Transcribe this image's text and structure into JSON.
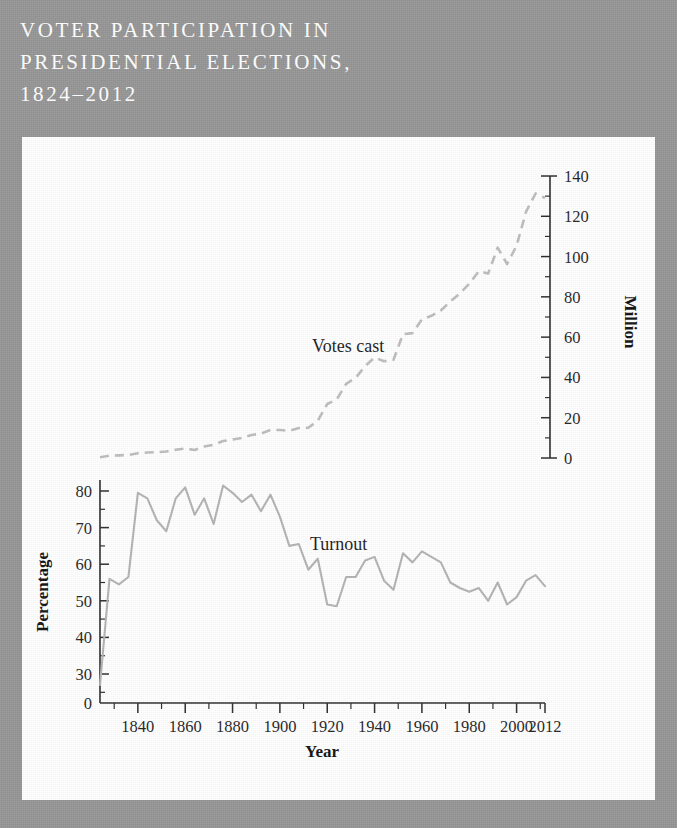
{
  "figure": {
    "title": "Voter Participation in\nPresidential Elections,\n1824–2012",
    "background_color": "#959595",
    "panel_color": "#ffffff",
    "title_color": "#ffffff"
  },
  "labels": {
    "votes_cast": "Votes cast",
    "turnout": "Turnout",
    "x_axis_title": "Year",
    "left_axis_title": "Percentage",
    "right_axis_title": "Million"
  },
  "chart_data": {
    "type": "line",
    "title": "Voter Participation in Presidential Elections, 1824–2012",
    "xlabel": "Year",
    "grid": false,
    "legend": "inline-annotations",
    "xlim": [
      1824,
      2012
    ],
    "x_ticks_major": [
      1840,
      1860,
      1880,
      1900,
      1920,
      1940,
      1960,
      1980,
      2000,
      2012
    ],
    "x_tick_labels": [
      "1840",
      "1860",
      "1880",
      "1900",
      "1920",
      "1940",
      "1960",
      "1980",
      "2000",
      "2012"
    ],
    "x_tick_minor_step": 10,
    "left_axis": {
      "label": "Percentage",
      "ylim": [
        25,
        85
      ],
      "ticks": [
        30,
        40,
        50,
        60,
        70,
        80
      ],
      "tick_labels": [
        "30",
        "40",
        "50",
        "60",
        "70",
        "80"
      ],
      "zero_label": "0",
      "minor_step": 5,
      "broken_axis": true,
      "color": "#b3b3b3"
    },
    "right_axis": {
      "label": "Million",
      "ylim": [
        0,
        140
      ],
      "ticks": [
        0,
        20,
        40,
        60,
        80,
        100,
        120,
        140
      ],
      "tick_labels": [
        "0",
        "20",
        "40",
        "60",
        "80",
        "100",
        "120",
        "140"
      ],
      "minor_step": 10,
      "color": "#bdbdbd"
    },
    "x": [
      1824,
      1828,
      1832,
      1836,
      1840,
      1844,
      1848,
      1852,
      1856,
      1860,
      1864,
      1868,
      1872,
      1876,
      1880,
      1884,
      1888,
      1892,
      1896,
      1900,
      1904,
      1908,
      1912,
      1916,
      1920,
      1924,
      1928,
      1932,
      1936,
      1940,
      1944,
      1948,
      1952,
      1956,
      1960,
      1964,
      1968,
      1972,
      1976,
      1980,
      1984,
      1988,
      1992,
      1996,
      2000,
      2004,
      2008,
      2012
    ],
    "series": [
      {
        "name": "Turnout",
        "axis": "left",
        "unit": "percent",
        "style": "solid",
        "values": [
          27.0,
          56.0,
          54.5,
          56.5,
          79.5,
          78.0,
          72.0,
          69.0,
          78.0,
          81.0,
          73.5,
          78.0,
          71.0,
          81.5,
          79.5,
          77.0,
          79.0,
          74.5,
          79.0,
          73.0,
          65.0,
          65.5,
          58.5,
          61.5,
          49.0,
          48.5,
          56.5,
          56.5,
          61.0,
          62.0,
          55.5,
          53.0,
          63.0,
          60.5,
          63.5,
          62.0,
          60.5,
          55.0,
          53.5,
          52.5,
          53.5,
          50.0,
          55.0,
          49.0,
          51.0,
          55.5,
          57.0,
          54.0
        ]
      },
      {
        "name": "Votes cast",
        "axis": "right",
        "unit": "million",
        "style": "dashed",
        "values": [
          0.4,
          1.2,
          1.3,
          1.5,
          2.4,
          2.7,
          2.9,
          3.2,
          4.1,
          4.7,
          4.0,
          5.7,
          6.5,
          8.4,
          9.2,
          10.0,
          11.4,
          12.1,
          13.9,
          13.9,
          13.5,
          14.9,
          15.0,
          18.5,
          26.8,
          29.1,
          36.8,
          39.8,
          45.6,
          49.9,
          48.0,
          48.8,
          61.5,
          62.0,
          68.8,
          70.6,
          73.2,
          77.7,
          81.6,
          86.5,
          92.7,
          91.6,
          104.4,
          96.3,
          105.4,
          122.3,
          131.3,
          129.1
        ]
      }
    ]
  }
}
